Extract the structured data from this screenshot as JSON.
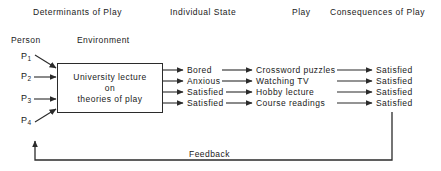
{
  "diagram": {
    "line_color": "#2b2b2b",
    "text_color": "#1a1a1a",
    "background": "#ffffff"
  },
  "columns": [
    {
      "label": "Determinants of Play"
    },
    {
      "label": "Individual State"
    },
    {
      "label": "Play"
    },
    {
      "label": "Consequences of Play"
    }
  ],
  "subheadings": [
    {
      "label": "Person"
    },
    {
      "label": "Environment"
    }
  ],
  "persons": [
    {
      "symbol": "P",
      "index": "1"
    },
    {
      "symbol": "P",
      "index": "2"
    },
    {
      "symbol": "P",
      "index": "3"
    },
    {
      "symbol": "P",
      "index": "4"
    }
  ],
  "environment_box": {
    "line1": "University  lecture",
    "line2": "on",
    "line3": "theories  of  play"
  },
  "rows": [
    {
      "state": "Bored",
      "play": "Crossword  puzzles",
      "consequence": "Satisfied"
    },
    {
      "state": "Anxious",
      "play": "Watching  TV",
      "consequence": "Satisfied"
    },
    {
      "state": "Satisfied",
      "play": "Hobby  lecture",
      "consequence": "Satisfied"
    },
    {
      "state": "Satisfied",
      "play": "Course  readings",
      "consequence": "Satisfied"
    }
  ],
  "feedback": {
    "label": "Feedback"
  }
}
